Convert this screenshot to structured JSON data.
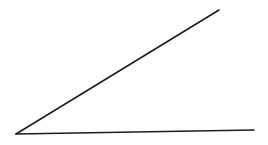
{
  "diagram": {
    "type": "angle",
    "background": "#ffffff",
    "stroke_color": "#1e1e1e",
    "stroke_width": 1.6,
    "vertex": {
      "x": 16,
      "y": 134
    },
    "rays": [
      {
        "name": "upper-ray",
        "end": {
          "x": 219,
          "y": 10
        }
      },
      {
        "name": "lower-ray",
        "end": {
          "x": 254,
          "y": 130
        }
      }
    ]
  }
}
